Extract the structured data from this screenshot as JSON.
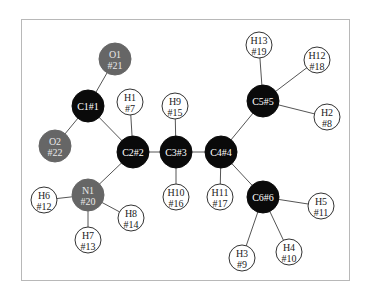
{
  "diagram": {
    "type": "molecular-graph",
    "colors": {
      "carbon": "#0a0a0a",
      "heteroatom": "#666666",
      "hydrogen": "#ffffff",
      "carbon_text": "#ffffff",
      "heteroatom_text": "#e8e8e8",
      "hydrogen_text": "#222222",
      "frame": "#b8b8b8",
      "bond": "#555555"
    },
    "atoms": [
      {
        "id": "C1",
        "line1": "C1#1",
        "line2": "",
        "kind": "carbon",
        "x": 88,
        "y": 106,
        "r": 16
      },
      {
        "id": "C2",
        "line1": "C2#2",
        "line2": "",
        "kind": "carbon",
        "x": 133,
        "y": 152,
        "r": 16
      },
      {
        "id": "C3",
        "line1": "C3#3",
        "line2": "",
        "kind": "carbon",
        "x": 176,
        "y": 152,
        "r": 16
      },
      {
        "id": "C4",
        "line1": "C4#4",
        "line2": "",
        "kind": "carbon",
        "x": 221,
        "y": 152,
        "r": 16
      },
      {
        "id": "C5",
        "line1": "C5#5",
        "line2": "",
        "kind": "carbon",
        "x": 263,
        "y": 101,
        "r": 16
      },
      {
        "id": "C6",
        "line1": "C6#6",
        "line2": "",
        "kind": "carbon",
        "x": 263,
        "y": 197,
        "r": 16
      },
      {
        "id": "O1",
        "line1": "O1",
        "line2": "#21",
        "kind": "heteroatom",
        "x": 115,
        "y": 59,
        "r": 16
      },
      {
        "id": "O2",
        "line1": "O2",
        "line2": "#22",
        "kind": "heteroatom",
        "x": 55,
        "y": 146,
        "r": 16
      },
      {
        "id": "N1",
        "line1": "N1",
        "line2": "#20",
        "kind": "heteroatom",
        "x": 88,
        "y": 195,
        "r": 16
      },
      {
        "id": "H1",
        "line1": "H1",
        "line2": "#7",
        "kind": "hydrogen",
        "x": 130,
        "y": 102,
        "r": 13
      },
      {
        "id": "H9",
        "line1": "H9",
        "line2": "#15",
        "kind": "hydrogen",
        "x": 175,
        "y": 106,
        "r": 13
      },
      {
        "id": "H10",
        "line1": "H10",
        "line2": "#16",
        "kind": "hydrogen",
        "x": 176,
        "y": 197,
        "r": 13
      },
      {
        "id": "H11",
        "line1": "H11",
        "line2": "#17",
        "kind": "hydrogen",
        "x": 220,
        "y": 197,
        "r": 13
      },
      {
        "id": "H6",
        "line1": "H6",
        "line2": "#12",
        "kind": "hydrogen",
        "x": 44,
        "y": 200,
        "r": 13
      },
      {
        "id": "H8",
        "line1": "H8",
        "line2": "#14",
        "kind": "hydrogen",
        "x": 131,
        "y": 218,
        "r": 13
      },
      {
        "id": "H7",
        "line1": "H7",
        "line2": "#13",
        "kind": "hydrogen",
        "x": 88,
        "y": 240,
        "r": 13
      },
      {
        "id": "H13",
        "line1": "H13",
        "line2": "#19",
        "kind": "hydrogen",
        "x": 259,
        "y": 45,
        "r": 13
      },
      {
        "id": "H12",
        "line1": "H12",
        "line2": "#18",
        "kind": "hydrogen",
        "x": 317,
        "y": 60,
        "r": 13
      },
      {
        "id": "H2",
        "line1": "H2",
        "line2": "#8",
        "kind": "hydrogen",
        "x": 327,
        "y": 117,
        "r": 13
      },
      {
        "id": "H5",
        "line1": "H5",
        "line2": "#11",
        "kind": "hydrogen",
        "x": 321,
        "y": 206,
        "r": 13
      },
      {
        "id": "H3",
        "line1": "H3",
        "line2": "#9",
        "kind": "hydrogen",
        "x": 242,
        "y": 258,
        "r": 13
      },
      {
        "id": "H4",
        "line1": "H4",
        "line2": "#10",
        "kind": "hydrogen",
        "x": 289,
        "y": 252,
        "r": 13
      }
    ],
    "bonds": [
      [
        "C1",
        "O1"
      ],
      [
        "C1",
        "O2"
      ],
      [
        "C1",
        "C2"
      ],
      [
        "C2",
        "H1"
      ],
      [
        "C2",
        "C3"
      ],
      [
        "C2",
        "N1"
      ],
      [
        "C3",
        "H9"
      ],
      [
        "C3",
        "H10"
      ],
      [
        "C3",
        "C4"
      ],
      [
        "C4",
        "H11"
      ],
      [
        "C4",
        "C5"
      ],
      [
        "C4",
        "C6"
      ],
      [
        "C5",
        "H13"
      ],
      [
        "C5",
        "H12"
      ],
      [
        "C5",
        "H2"
      ],
      [
        "C6",
        "H5"
      ],
      [
        "C6",
        "H3"
      ],
      [
        "C6",
        "H4"
      ],
      [
        "N1",
        "H6"
      ],
      [
        "N1",
        "H8"
      ],
      [
        "N1",
        "H7"
      ]
    ]
  }
}
